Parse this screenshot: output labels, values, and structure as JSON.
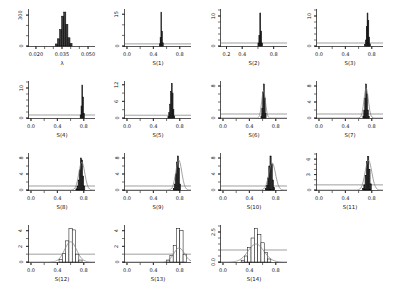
{
  "figure": {
    "background": "#ffffff",
    "colors": {
      "bar_fill": "#3d3d3d",
      "bar_stroke": "#000000",
      "outline_bar_fill": "#ffffff",
      "density_curve": "#7d7d7d",
      "prior_line": "#606060",
      "axis": "#111111",
      "text": "#111111"
    }
  },
  "chart_data": {
    "type": "bar",
    "panels": [
      {
        "id": "lambda",
        "xlabel": "λ",
        "xmin": 0.016,
        "xmax": 0.054,
        "ymax": 350,
        "x_ticks": [
          {
            "v": 0.02,
            "label": "0.020"
          },
          {
            "v": 0.035,
            "label": "0.035"
          },
          {
            "v": 0.05,
            "label": "0.050"
          }
        ],
        "x_minor": 0.005,
        "y_minor": 100,
        "y_ticks": [
          {
            "v": 0,
            "label": "0"
          },
          {
            "v": 300,
            "label": "300"
          }
        ],
        "bins": {
          "start": 0.0312,
          "width": 0.0012,
          "heights": [
            20,
            70,
            160,
            290,
            330,
            210,
            80,
            25
          ]
        },
        "style": "filled",
        "prior": null,
        "curve": null
      },
      {
        "id": "s1",
        "xlabel": "S(1)",
        "xmin": -0.03,
        "xmax": 0.97,
        "ymax": 17,
        "x_ticks": [
          {
            "v": 0.0,
            "label": "0.0"
          },
          {
            "v": 0.4,
            "label": "0.4"
          },
          {
            "v": 0.8,
            "label": "0.8"
          }
        ],
        "x_minor": 0.2,
        "y_minor": 5,
        "y_ticks": [
          {
            "v": 0,
            "label": "0"
          },
          {
            "v": 15,
            "label": "15"
          }
        ],
        "bins": {
          "start": 0.49,
          "width": 0.012,
          "heights": [
            1,
            4,
            16,
            7,
            1.5
          ]
        },
        "style": "filled",
        "prior": 1,
        "curve": null
      },
      {
        "id": "s2",
        "xlabel": "S(2)",
        "xmin": 0.13,
        "xmax": 0.97,
        "ymax": 12,
        "x_ticks": [
          {
            "v": 0.2,
            "label": "0.2"
          },
          {
            "v": 0.4,
            "label": "0.4"
          },
          {
            "v": 0.8,
            "label": "0.8"
          }
        ],
        "x_minor": 0.2,
        "y_minor": 2,
        "y_ticks": [
          {
            "v": 0,
            "label": "0"
          },
          {
            "v": 10,
            "label": "10"
          }
        ],
        "bins": {
          "start": 0.6,
          "width": 0.012,
          "heights": [
            1,
            3.5,
            11,
            5,
            1
          ]
        },
        "style": "filled",
        "prior": 1,
        "curve": null
      },
      {
        "id": "s3",
        "xlabel": "S(3)",
        "xmin": -0.03,
        "xmax": 0.97,
        "ymax": 12,
        "x_ticks": [
          {
            "v": 0.0,
            "label": "0.0"
          },
          {
            "v": 0.4,
            "label": "0.4"
          },
          {
            "v": 0.8,
            "label": "0.8"
          }
        ],
        "x_minor": 0.2,
        "y_minor": 2,
        "y_ticks": [
          {
            "v": 0,
            "label": "0"
          },
          {
            "v": 10,
            "label": "10"
          }
        ],
        "bins": {
          "start": 0.69,
          "width": 0.013,
          "heights": [
            0.5,
            2,
            6.5,
            11,
            8.5,
            3,
            0.7
          ]
        },
        "style": "filled",
        "prior": 1,
        "curve": null
      },
      {
        "id": "s4",
        "xlabel": "S(4)",
        "xmin": -0.03,
        "xmax": 0.97,
        "ymax": 12,
        "x_ticks": [
          {
            "v": 0.0,
            "label": "0.0"
          },
          {
            "v": 0.4,
            "label": "0.4"
          },
          {
            "v": 0.8,
            "label": "0.8"
          }
        ],
        "x_minor": 0.2,
        "y_minor": 2,
        "y_ticks": [
          {
            "v": 0,
            "label": "0"
          },
          {
            "v": 10,
            "label": "10"
          }
        ],
        "bins": {
          "start": 0.745,
          "width": 0.013,
          "heights": [
            1,
            4,
            11,
            7,
            1.5
          ]
        },
        "style": "filled",
        "prior": 1,
        "curve": null
      },
      {
        "id": "s5",
        "xlabel": "S(5)",
        "xmin": -0.03,
        "xmax": 0.97,
        "ymax": 13,
        "x_ticks": [
          {
            "v": 0.0,
            "label": "0.0"
          },
          {
            "v": 0.4,
            "label": "0.4"
          },
          {
            "v": 0.8,
            "label": "0.8"
          }
        ],
        "x_minor": 0.2,
        "y_minor": 3,
        "y_ticks": [
          {
            "v": 0,
            "label": "0"
          },
          {
            "v": 6,
            "label": "6"
          },
          {
            "v": 12,
            "label": "12"
          }
        ],
        "bins": {
          "start": 0.62,
          "width": 0.013,
          "heights": [
            0.5,
            2,
            5,
            9.5,
            12.5,
            9,
            3,
            0.7
          ]
        },
        "style": "filled",
        "prior": 1,
        "curve": null
      },
      {
        "id": "s6",
        "xlabel": "S(6)",
        "xmin": -0.03,
        "xmax": 0.97,
        "ymax": 9,
        "x_ticks": [
          {
            "v": 0.0,
            "label": "0.0"
          },
          {
            "v": 0.4,
            "label": "0.4"
          },
          {
            "v": 0.8,
            "label": "0.8"
          }
        ],
        "x_minor": 0.2,
        "y_minor": 2,
        "y_ticks": [
          {
            "v": 0,
            "label": "0"
          },
          {
            "v": 8,
            "label": "8"
          }
        ],
        "bins": {
          "start": 0.575,
          "width": 0.013,
          "heights": [
            0.5,
            2.5,
            6.5,
            8.5,
            5,
            1.2
          ]
        },
        "style": "filled",
        "prior": 1,
        "curve": {
          "center": 0.615,
          "sd": 0.028,
          "amp": 7
        }
      },
      {
        "id": "s7",
        "xlabel": "S(7)",
        "xmin": -0.03,
        "xmax": 0.97,
        "ymax": 9,
        "x_ticks": [
          {
            "v": 0.0,
            "label": "0.0"
          },
          {
            "v": 0.4,
            "label": "0.4"
          },
          {
            "v": 0.8,
            "label": "0.8"
          }
        ],
        "x_minor": 0.2,
        "y_minor": 2,
        "y_ticks": [
          {
            "v": 0,
            "label": "0"
          },
          {
            "v": 4,
            "label": "4"
          },
          {
            "v": 8,
            "label": "8"
          }
        ],
        "bins": {
          "start": 0.665,
          "width": 0.014,
          "heights": [
            0.5,
            2,
            5,
            8.5,
            6,
            2,
            0.4
          ]
        },
        "style": "filled",
        "prior": 1,
        "curve": {
          "center": 0.715,
          "sd": 0.033,
          "amp": 7.5
        }
      },
      {
        "id": "s8",
        "xlabel": "S(8)",
        "xmin": -0.03,
        "xmax": 0.97,
        "ymax": 9,
        "x_ticks": [
          {
            "v": 0.0,
            "label": "0.0"
          },
          {
            "v": 0.4,
            "label": "0.4"
          },
          {
            "v": 0.8,
            "label": "0.8"
          }
        ],
        "x_minor": 0.2,
        "y_minor": 2,
        "y_ticks": [
          {
            "v": 0,
            "label": "0"
          },
          {
            "v": 4,
            "label": "4"
          },
          {
            "v": 8,
            "label": "8"
          }
        ],
        "bins": {
          "start": 0.68,
          "width": 0.017,
          "heights": [
            0.3,
            1,
            2.5,
            5,
            8,
            7.5,
            3.5,
            1
          ]
        },
        "style": "filled",
        "prior": 1,
        "curve": {
          "center": 0.77,
          "sd": 0.045,
          "amp": 7
        }
      },
      {
        "id": "s9",
        "xlabel": "S(9)",
        "xmin": -0.03,
        "xmax": 0.97,
        "ymax": 9,
        "x_ticks": [
          {
            "v": 0.0,
            "label": "0.0"
          },
          {
            "v": 0.4,
            "label": "0.4"
          },
          {
            "v": 0.8,
            "label": "0.8"
          }
        ],
        "x_minor": 0.2,
        "y_minor": 2,
        "y_ticks": [
          {
            "v": 0,
            "label": "0"
          },
          {
            "v": 4,
            "label": "4"
          },
          {
            "v": 8,
            "label": "8"
          }
        ],
        "bins": {
          "start": 0.7,
          "width": 0.016,
          "heights": [
            0.4,
            1.5,
            4,
            7,
            8.5,
            5.5,
            1.5
          ]
        },
        "style": "filled",
        "prior": 1,
        "curve": {
          "center": 0.785,
          "sd": 0.045,
          "amp": 7.5
        }
      },
      {
        "id": "s10",
        "xlabel": "S(10)",
        "xmin": -0.03,
        "xmax": 0.97,
        "ymax": 9,
        "x_ticks": [
          {
            "v": 0.0,
            "label": "0.0"
          },
          {
            "v": 0.4,
            "label": "0.4"
          },
          {
            "v": 0.8,
            "label": "0.8"
          }
        ],
        "x_minor": 0.2,
        "y_minor": 2,
        "y_ticks": [
          {
            "v": 0,
            "label": "0"
          },
          {
            "v": 4,
            "label": "4"
          },
          {
            "v": 8,
            "label": "8"
          }
        ],
        "bins": {
          "start": 0.64,
          "width": 0.018,
          "heights": [
            0.4,
            1.2,
            3,
            6,
            8.5,
            6.5,
            2.5,
            0.6
          ]
        },
        "style": "filled",
        "prior": 1,
        "curve": {
          "center": 0.745,
          "sd": 0.05,
          "amp": 6.8
        }
      },
      {
        "id": "s11",
        "xlabel": "S(11)",
        "xmin": -0.03,
        "xmax": 0.97,
        "ymax": 7,
        "x_ticks": [
          {
            "v": 0.0,
            "label": "0.0"
          },
          {
            "v": 0.4,
            "label": "0.4"
          },
          {
            "v": 0.8,
            "label": "0.8"
          }
        ],
        "x_minor": 0.2,
        "y_minor": 1,
        "y_ticks": [
          {
            "v": 0,
            "label": "0"
          },
          {
            "v": 3,
            "label": "3"
          },
          {
            "v": 6,
            "label": "6"
          }
        ],
        "bins": {
          "start": 0.66,
          "width": 0.019,
          "heights": [
            0.3,
            1,
            2.8,
            5.5,
            6.5,
            4,
            1.2
          ]
        },
        "style": "filled",
        "prior": 1,
        "curve": {
          "center": 0.75,
          "sd": 0.05,
          "amp": 5.8
        }
      },
      {
        "id": "s12",
        "xlabel": "S(12)",
        "xmin": -0.03,
        "xmax": 0.97,
        "ymax": 4.6,
        "x_ticks": [
          {
            "v": 0.0,
            "label": "0.0"
          },
          {
            "v": 0.4,
            "label": "0.4"
          },
          {
            "v": 0.8,
            "label": "0.8"
          }
        ],
        "x_minor": 0.2,
        "y_minor": 1,
        "y_ticks": [
          {
            "v": 0,
            "label": "0"
          },
          {
            "v": 2,
            "label": "2"
          },
          {
            "v": 4,
            "label": "4"
          }
        ],
        "bins": {
          "start": 0.425,
          "width": 0.05,
          "heights": [
            0.3,
            1.1,
            2.7,
            4.3,
            4.1,
            1.0,
            0.25
          ]
        },
        "style": "outline",
        "prior": 1,
        "curve": {
          "center": 0.6,
          "sd": 0.09,
          "amp": 2.6
        }
      },
      {
        "id": "s13",
        "xlabel": "S(13)",
        "xmin": -0.03,
        "xmax": 0.97,
        "ymax": 4.6,
        "x_ticks": [
          {
            "v": 0.0,
            "label": "0.0"
          },
          {
            "v": 0.4,
            "label": "0.4"
          },
          {
            "v": 0.8,
            "label": "0.8"
          }
        ],
        "x_minor": 0.2,
        "y_minor": 1,
        "y_ticks": [
          {
            "v": 0,
            "label": "0"
          },
          {
            "v": 2,
            "label": "2"
          },
          {
            "v": 4,
            "label": "4"
          }
        ],
        "bins": {
          "start": 0.6,
          "width": 0.05,
          "heights": [
            0.25,
            0.8,
            2.1,
            4.3,
            4.0,
            1.0
          ]
        },
        "style": "outline",
        "prior": 1,
        "curve": {
          "center": 0.79,
          "sd": 0.08,
          "amp": 1.8
        }
      },
      {
        "id": "s14",
        "xlabel": "S(14)",
        "xmin": -0.03,
        "xmax": 0.97,
        "ymax": 3.0,
        "x_ticks": [
          {
            "v": 0.0,
            "label": "0.0"
          },
          {
            "v": 0.4,
            "label": "0.4"
          },
          {
            "v": 0.8,
            "label": "0.8"
          }
        ],
        "x_minor": 0.2,
        "y_minor": 0.5,
        "y_ticks": [
          {
            "v": 0,
            "label": "0.0"
          },
          {
            "v": 2.5,
            "label": "2.5"
          }
        ],
        "bins": {
          "start": 0.275,
          "width": 0.05,
          "heights": [
            0.15,
            0.5,
            1.2,
            2.0,
            2.8,
            2.3,
            1.6,
            0.8,
            0.25
          ]
        },
        "style": "outline",
        "prior": 1,
        "curve": {
          "center": 0.5,
          "sd": 0.12,
          "amp": 1.5
        }
      }
    ]
  }
}
